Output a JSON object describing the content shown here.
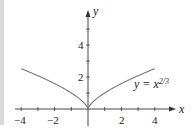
{
  "chart_data": {
    "type": "line",
    "title": "",
    "xlabel": "x",
    "ylabel": "y",
    "xlim": [
      -4.3,
      4.9
    ],
    "ylim": [
      -1.1,
      5.9
    ],
    "x_ticks": [
      -4,
      -3,
      -2,
      -1,
      1,
      2,
      3,
      4
    ],
    "x_tick_labels": [
      "-4",
      "-2",
      "2",
      "4"
    ],
    "x_tick_label_values": [
      -4,
      -2,
      2,
      4
    ],
    "y_ticks": [
      1,
      2,
      3,
      4,
      5
    ],
    "y_tick_labels": [
      "2",
      "4"
    ],
    "y_tick_label_values": [
      2,
      4
    ],
    "grid": false,
    "legend": "none",
    "series": [
      {
        "name": "y = x^(2/3)",
        "x": [
          -4,
          -3,
          -2,
          -1,
          -0.5,
          -0.1,
          0,
          0.1,
          0.5,
          1,
          2,
          3,
          4
        ],
        "values": [
          2.52,
          2.08,
          1.59,
          1.0,
          0.63,
          0.22,
          0,
          0.22,
          0.63,
          1.0,
          1.59,
          2.08,
          2.52
        ]
      }
    ],
    "annotations": [
      {
        "text": "y = x^{2/3}",
        "x": 3.6,
        "y": 1.4
      }
    ]
  },
  "labels": {
    "x_axis": "x",
    "y_axis": "y",
    "curve_eq_prefix": "y = x",
    "curve_eq_exponent": "2/3",
    "tick_neg4": "−4",
    "tick_neg2": "−2",
    "tick_2": "2",
    "tick_4": "4",
    "ytick_2": "2",
    "ytick_4": "4"
  }
}
